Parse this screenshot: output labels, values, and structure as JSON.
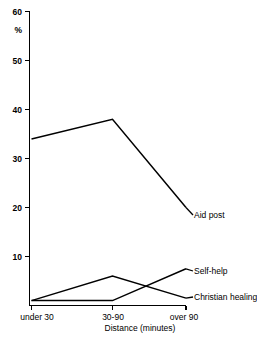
{
  "chart_data": {
    "type": "line",
    "title": "",
    "subtitle": "",
    "xlabel": "Distance (minutes)",
    "ylabel": "%",
    "categories": [
      "under 30",
      "30-90",
      "over 90"
    ],
    "ytick_labels": [
      "10",
      "20",
      "30",
      "40",
      "50",
      "60"
    ],
    "ytick_values": [
      10,
      20,
      30,
      40,
      50,
      60
    ],
    "ylim": [
      0,
      60
    ],
    "grid": false,
    "legend_position": "inline-right-labels",
    "series": [
      {
        "name": "Aid post",
        "values": [
          34,
          38,
          20
        ],
        "color": "#000000"
      },
      {
        "name": "Self-help",
        "values": [
          1,
          1,
          7.5
        ],
        "color": "#000000"
      },
      {
        "name": "Christian healing",
        "values": [
          1,
          6,
          1.5
        ],
        "color": "#000000"
      }
    ]
  },
  "axes": {
    "y_tick_60": "60",
    "y_tick_50": "50",
    "y_tick_40": "40",
    "y_tick_30": "30",
    "y_tick_20": "20",
    "y_tick_10": "10",
    "y_unit": "%",
    "x_tick_1": "under 30",
    "x_tick_2": "30-90",
    "x_tick_3": "over 90",
    "x_axis_title": "Distance (minutes)"
  },
  "labels": {
    "aid_post": "Aid post",
    "self_help": "Self-help",
    "christian_healing": "Christian healing"
  },
  "colors": {
    "line": "#000000",
    "axis": "#000000",
    "background": "#ffffff"
  }
}
